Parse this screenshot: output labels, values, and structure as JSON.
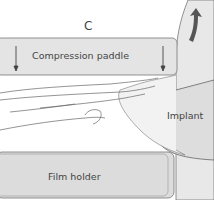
{
  "panel_label": "C",
  "labels": {
    "paddle": "Compression paddle",
    "implant": "Implant",
    "film_holder": "Film holder"
  },
  "colors": {
    "paddle_fill": "#e4e4e4",
    "film_fill": "#dcdcdc",
    "chest_fill": "#e8e8e8",
    "implant_fill": "#dddddd",
    "arrow": "#555555",
    "outline": "#666666"
  }
}
